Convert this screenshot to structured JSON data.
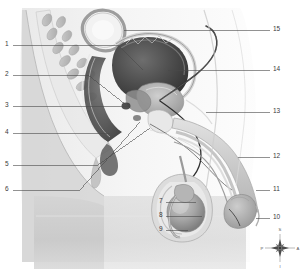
{
  "figure": {
    "style": "grayscale-medical-illustration",
    "background": "#ffffff",
    "line_color": "#4a4a4a",
    "label_color": "#3a3a3a"
  },
  "labels": {
    "left": [
      {
        "number": "1",
        "x": 6,
        "y": 45,
        "line_to_x": 118,
        "line_to_y": 45
      },
      {
        "number": "2",
        "x": 6,
        "y": 75,
        "line_to_x": 88,
        "line_to_y": 75
      },
      {
        "number": "3",
        "x": 6,
        "y": 106,
        "line_to_x": 128,
        "line_to_y": 106
      },
      {
        "number": "4",
        "x": 6,
        "y": 133,
        "line_to_x": 110,
        "line_to_y": 133
      },
      {
        "number": "5",
        "x": 6,
        "y": 165,
        "line_to_x": 150,
        "line_to_y": 165
      },
      {
        "number": "6",
        "x": 6,
        "y": 190,
        "line_to_x": 80,
        "line_to_y": 190
      }
    ],
    "center": [
      {
        "number": "7",
        "x": 160,
        "y": 202,
        "line_to_x": 196,
        "line_to_y": 202
      },
      {
        "number": "8",
        "x": 160,
        "y": 216,
        "line_to_x": 200,
        "line_to_y": 216
      },
      {
        "number": "9",
        "x": 160,
        "y": 230,
        "line_to_x": 188,
        "line_to_y": 230
      }
    ],
    "right": [
      {
        "number": "15",
        "x": 274,
        "y": 30,
        "line_to_x": 124,
        "line_to_y": 30
      },
      {
        "number": "14",
        "x": 274,
        "y": 70,
        "line_to_x": 172,
        "line_to_y": 70
      },
      {
        "number": "13",
        "x": 274,
        "y": 112,
        "line_to_x": 205,
        "line_to_y": 112
      },
      {
        "number": "12",
        "x": 274,
        "y": 157,
        "line_to_x": 240,
        "line_to_y": 157
      },
      {
        "number": "11",
        "x": 274,
        "y": 190,
        "line_to_x": 256,
        "line_to_y": 190
      },
      {
        "number": "10",
        "x": 274,
        "y": 218,
        "line_to_x": 256,
        "line_to_y": 218
      }
    ]
  },
  "compass": {
    "superior": "S",
    "inferior": "I",
    "posterior": "P",
    "anterior": "A",
    "cx": 280,
    "cy": 248
  }
}
